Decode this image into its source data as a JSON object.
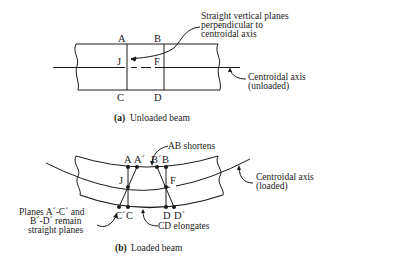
{
  "figure": {
    "panel_a": {
      "caption_tag": "(a)",
      "caption_text": "Unloaded beam",
      "points": {
        "A": "A",
        "B": "B",
        "J": "J",
        "F": "F",
        "C": "C",
        "D": "D"
      },
      "annotations": {
        "planes_line1": "Straight vertical planes",
        "planes_line2": "perpendicular to",
        "planes_line3": "centroidal axis",
        "axis_line1": "Centroidal axis",
        "axis_line2": "(unloaded)"
      }
    },
    "panel_b": {
      "caption_tag": "(b)",
      "caption_text": "Loaded beam",
      "points": {
        "A": "A",
        "A_prime": "A´",
        "B_prime": "B´",
        "B": "B",
        "J": "J",
        "F": "F",
        "C_prime": "C´",
        "C": "C",
        "D": "D",
        "D_prime": "D´"
      },
      "annotations": {
        "ab_shortens": "AB shortens",
        "cd_elongates": "CD elongates",
        "axis_line1": "Centroidal axis",
        "axis_line2": "(loaded)",
        "planes_line1": "Planes A´-C´ and",
        "planes_line2": "B´-D´ remain",
        "planes_line3": "straight planes"
      }
    },
    "colors": {
      "ink": "#1a1a1a",
      "background": "#ffffff"
    }
  }
}
